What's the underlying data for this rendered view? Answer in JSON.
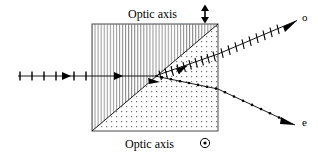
{
  "figure": {
    "background_color": "#ffffff",
    "line_color": "#000000",
    "width": 318,
    "height": 157
  },
  "labels": {
    "top_optic_axis": "Optic axis",
    "top_optic_axis_symbol": "↕",
    "top_optic_axis_symbol_name": "vertical-double-arrow",
    "bottom_optic_axis": "Optic axis",
    "bottom_optic_axis_symbol": "⊙",
    "bottom_optic_axis_symbol_name": "circled-dot-out-of-page",
    "ordinary_ray": "o",
    "extraordinary_ray": "e"
  },
  "crystal": {
    "box": {
      "x": 92,
      "y": 24,
      "width": 126,
      "height": 107
    },
    "upper_region_fill": "vertical-hatch",
    "lower_region_fill": "dot-stipple",
    "diagonal": {
      "x1": 92,
      "y1": 131,
      "x2": 218,
      "y2": 24
    },
    "border_color": "#555555"
  },
  "rays": {
    "incident": {
      "name": "incident-unpolarized-ray",
      "x1": 18,
      "y1": 76,
      "x2": 155,
      "y2": 76,
      "marker": "tick",
      "description": "incoming beam with polarization tick marks"
    },
    "ordinary": {
      "name": "ordinary-ray",
      "marker": "tick",
      "label": "o",
      "segments": [
        {
          "x1": 155,
          "y1": 76,
          "x2": 218,
          "y2": 54
        },
        {
          "x1": 218,
          "y1": 54,
          "x2": 298,
          "y2": 20
        }
      ]
    },
    "extraordinary": {
      "name": "extraordinary-ray",
      "marker": "dot",
      "label": "e",
      "segments": [
        {
          "x1": 155,
          "y1": 76,
          "x2": 218,
          "y2": 89
        },
        {
          "x1": 218,
          "y1": 89,
          "x2": 296,
          "y2": 126
        }
      ]
    }
  }
}
